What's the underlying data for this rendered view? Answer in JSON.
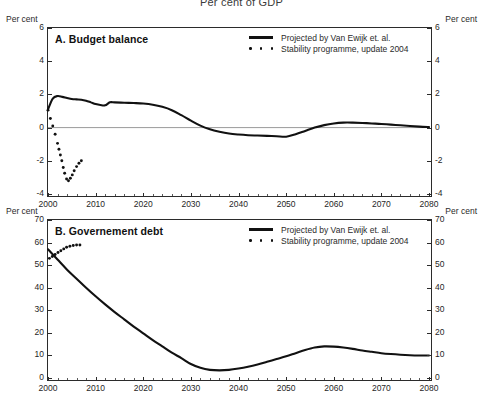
{
  "figure": {
    "title": "Per cent of GDP",
    "unit_label": "Per cent"
  },
  "legend": {
    "solid_label": "Projected by Van Ewijk et. al.",
    "dotted_label": "Stability programme, update 2004"
  },
  "panels": {
    "a": {
      "label": "A. Budget balance",
      "unit_left": "Per cent",
      "unit_right": "Per cent"
    },
    "b": {
      "label": "B. Governement debt",
      "unit_left": "Per cent",
      "unit_right": "Per cent"
    }
  },
  "chart_data": [
    {
      "type": "line",
      "id": "panel-a",
      "title": "A. Budget balance",
      "suptitle": "Per cent of GDP",
      "xlabel": "",
      "ylabel": "Per cent",
      "xlim": [
        2000,
        2080
      ],
      "ylim": [
        -4,
        6
      ],
      "yticks": [
        6,
        4,
        2,
        0,
        -2,
        -4
      ],
      "xticks": [
        2000,
        2010,
        2020,
        2030,
        2040,
        2050,
        2060,
        2070,
        2080
      ],
      "grid": false,
      "zero_line": true,
      "legend_position": "top-right",
      "series": [
        {
          "name": "Projected by Van Ewijk et. al.",
          "style": "solid",
          "x": [
            2000,
            2001,
            2002,
            2003,
            2004,
            2005,
            2006,
            2007,
            2008,
            2009,
            2010,
            2011,
            2012,
            2013,
            2014,
            2016,
            2018,
            2020,
            2022,
            2024,
            2026,
            2028,
            2030,
            2032,
            2034,
            2036,
            2038,
            2040,
            2042,
            2044,
            2046,
            2048,
            2050,
            2052,
            2054,
            2056,
            2058,
            2060,
            2062,
            2064,
            2066,
            2068,
            2070,
            2072,
            2074,
            2076,
            2078,
            2080
          ],
          "y": [
            1.1,
            1.75,
            1.9,
            1.85,
            1.78,
            1.72,
            1.7,
            1.68,
            1.62,
            1.52,
            1.42,
            1.36,
            1.34,
            1.52,
            1.52,
            1.5,
            1.48,
            1.45,
            1.38,
            1.25,
            1.05,
            0.75,
            0.42,
            0.12,
            -0.1,
            -0.25,
            -0.36,
            -0.42,
            -0.46,
            -0.48,
            -0.5,
            -0.52,
            -0.55,
            -0.4,
            -0.2,
            0.0,
            0.15,
            0.25,
            0.3,
            0.3,
            0.28,
            0.25,
            0.22,
            0.18,
            0.14,
            0.1,
            0.06,
            0.03
          ]
        },
        {
          "name": "Stability programme, update 2004",
          "style": "dotted",
          "x": [
            2000.0,
            2000.5,
            2001.0,
            2001.5,
            2002.0,
            2002.3,
            2002.6,
            2002.9,
            2003.2,
            2003.5,
            2003.9,
            2004.3,
            2004.7,
            2005.1,
            2005.5,
            2006.0,
            2006.5,
            2007.0
          ],
          "y": [
            1.05,
            0.55,
            0.1,
            -0.4,
            -0.95,
            -1.3,
            -1.65,
            -2.0,
            -2.4,
            -2.75,
            -3.1,
            -3.2,
            -3.05,
            -2.85,
            -2.6,
            -2.35,
            -2.15,
            -2.0
          ]
        }
      ]
    },
    {
      "type": "line",
      "id": "panel-b",
      "title": "B. Governement debt",
      "xlabel": "",
      "ylabel": "Per cent",
      "xlim": [
        2000,
        2080
      ],
      "ylim": [
        0,
        70
      ],
      "yticks": [
        0,
        10,
        20,
        30,
        40,
        50,
        60,
        70
      ],
      "xticks": [
        2000,
        2010,
        2020,
        2030,
        2040,
        2050,
        2060,
        2070,
        2080
      ],
      "grid": false,
      "zero_line": false,
      "legend_position": "top-right",
      "series": [
        {
          "name": "Projected by Van Ewijk et. al.",
          "style": "solid",
          "x": [
            2000,
            2002,
            2004,
            2006,
            2008,
            2010,
            2012,
            2014,
            2016,
            2018,
            2020,
            2022,
            2024,
            2026,
            2028,
            2030,
            2032,
            2034,
            2036,
            2038,
            2040,
            2042,
            2044,
            2046,
            2048,
            2050,
            2052,
            2054,
            2056,
            2058,
            2060,
            2062,
            2064,
            2066,
            2068,
            2070,
            2072,
            2074,
            2076,
            2078,
            2080
          ],
          "y": [
            57.0,
            52.5,
            48.0,
            44.0,
            40.0,
            36.2,
            32.6,
            29.2,
            26.0,
            22.8,
            19.8,
            16.8,
            14.0,
            11.2,
            8.8,
            6.2,
            4.5,
            3.6,
            3.4,
            3.6,
            4.2,
            5.0,
            6.0,
            7.2,
            8.4,
            9.6,
            11.0,
            12.4,
            13.5,
            14.0,
            13.9,
            13.5,
            12.9,
            12.2,
            11.6,
            11.0,
            10.6,
            10.3,
            10.1,
            10.0,
            10.0
          ]
        },
        {
          "name": "Stability programme, update 2004",
          "style": "dotted",
          "x": [
            2000.3,
            2000.9,
            2001.5,
            2002.1,
            2002.7,
            2003.3,
            2003.9,
            2004.6,
            2005.3,
            2006.0,
            2006.7
          ],
          "y": [
            53.0,
            53.8,
            54.7,
            55.6,
            56.4,
            57.2,
            57.9,
            58.4,
            58.7,
            58.9,
            58.9
          ]
        }
      ]
    }
  ]
}
